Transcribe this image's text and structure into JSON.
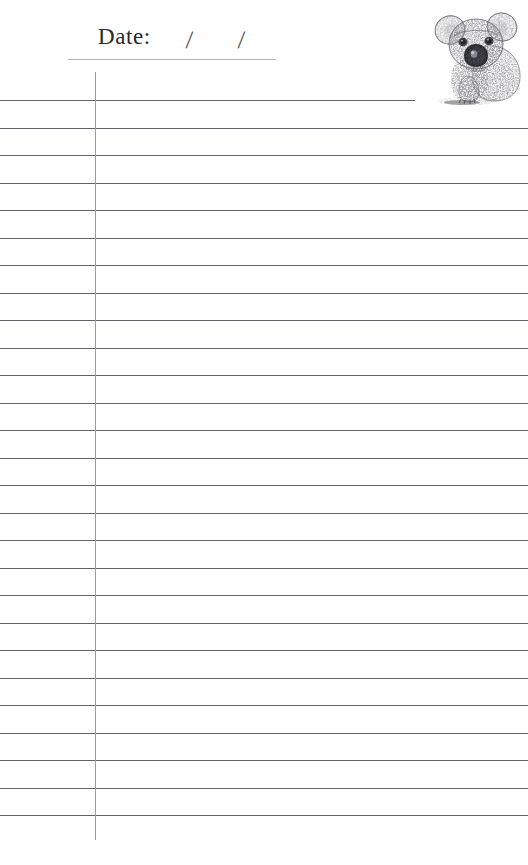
{
  "page": {
    "kind": "ruled-notepad-sheet",
    "background_color": "#ffffff",
    "width": 528,
    "height": 865
  },
  "header": {
    "date_label": "Date:",
    "slash_1": "/",
    "slash_2": "/",
    "underline_color": "#b3b3ba"
  },
  "artwork": {
    "name": "koala-illustration",
    "subject": "Koala",
    "style": "stipple pen-and-ink drawing",
    "position": "top-right",
    "ink_color": "#3b3b40"
  },
  "ruling": {
    "line_color": "#63636b",
    "margin_line_color": "#9a9aa4",
    "margin_line_x": 95,
    "line_spacing": 27.5,
    "first_line_y": 100,
    "line_count": 27,
    "first_line_width": 415,
    "full_line_width": 528,
    "lines": [
      {
        "y": 100,
        "width": 415
      },
      {
        "y": 127.5,
        "width": 528
      },
      {
        "y": 155,
        "width": 528
      },
      {
        "y": 182.5,
        "width": 528
      },
      {
        "y": 210,
        "width": 528
      },
      {
        "y": 237.5,
        "width": 528
      },
      {
        "y": 265,
        "width": 528
      },
      {
        "y": 292.5,
        "width": 528
      },
      {
        "y": 320,
        "width": 528
      },
      {
        "y": 347.5,
        "width": 528
      },
      {
        "y": 375,
        "width": 528
      },
      {
        "y": 402.5,
        "width": 528
      },
      {
        "y": 430,
        "width": 528
      },
      {
        "y": 457.5,
        "width": 528
      },
      {
        "y": 485,
        "width": 528
      },
      {
        "y": 512.5,
        "width": 528
      },
      {
        "y": 540,
        "width": 528
      },
      {
        "y": 567.5,
        "width": 528
      },
      {
        "y": 595,
        "width": 528
      },
      {
        "y": 622.5,
        "width": 528
      },
      {
        "y": 650,
        "width": 528
      },
      {
        "y": 677.5,
        "width": 528
      },
      {
        "y": 705,
        "width": 528
      },
      {
        "y": 732.5,
        "width": 528
      },
      {
        "y": 760,
        "width": 528
      },
      {
        "y": 787.5,
        "width": 528
      },
      {
        "y": 815,
        "width": 528
      }
    ]
  }
}
